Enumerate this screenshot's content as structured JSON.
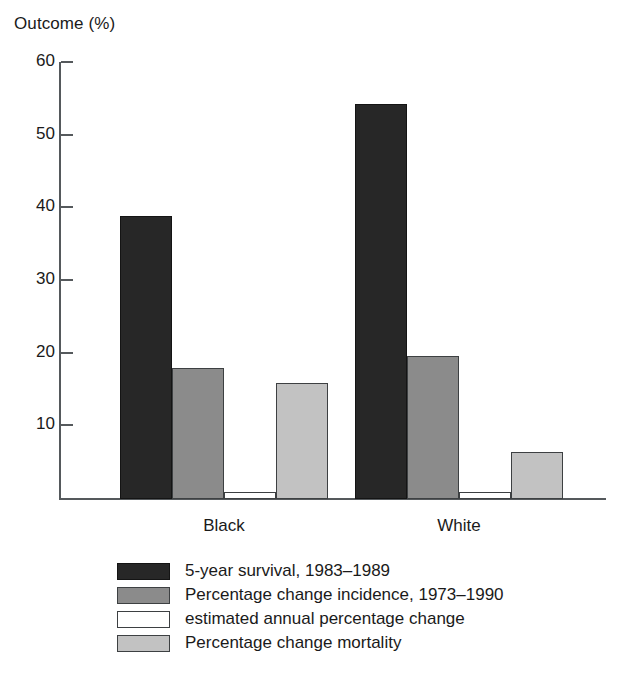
{
  "chart_data": {
    "type": "bar",
    "title": "",
    "subtitle": "",
    "ylabel": "Outcome (%)",
    "xlabel": "",
    "ylim": [
      0,
      60
    ],
    "yticks": [
      60,
      50,
      40,
      30,
      20,
      10
    ],
    "grid": false,
    "legend_position": "bottom-left",
    "categories": [
      "Black",
      "White"
    ],
    "series": [
      {
        "name": "5-year survival, 1983–1989",
        "color": "#272727",
        "values": [
          39.0,
          54.3
        ]
      },
      {
        "name": "Percentage change incidence, 1973–1990",
        "color": "#8b8b8b",
        "values": [
          18.0,
          19.7
        ]
      },
      {
        "name": "estimated annual percentage change",
        "color": "#ffffff",
        "values": [
          1.0,
          1.0
        ]
      },
      {
        "name": "Percentage change mortality",
        "color": "#c2c2c2",
        "values": [
          16.0,
          6.5
        ]
      }
    ]
  },
  "axis": {
    "y_title": "Outcome (%)",
    "tick_labels": [
      "60",
      "50",
      "40",
      "30",
      "20",
      "10"
    ]
  },
  "categories": [
    {
      "label": "Black"
    },
    {
      "label": "White"
    }
  ],
  "legend": {
    "items": [
      {
        "label": "5-year survival, 1983–1989"
      },
      {
        "label": "Percentage change incidence, 1973–1990"
      },
      {
        "label": "estimated annual percentage change"
      },
      {
        "label": "Percentage change mortality"
      }
    ]
  }
}
